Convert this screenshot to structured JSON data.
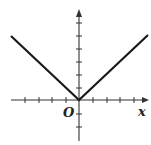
{
  "diagram": {
    "type": "function-graph",
    "function": "y = |x|",
    "axes": {
      "x_label": "x",
      "origin_label": "O",
      "x_ticks_left": 4,
      "x_ticks_right": 4,
      "y_ticks_above": 6,
      "y_ticks_below": 2,
      "tick_spacing_px": 13.6
    },
    "graph_lines": [
      {
        "name": "left-branch",
        "from": [
          0,
          0
        ],
        "to": [
          -5,
          5
        ]
      },
      {
        "name": "right-branch",
        "from": [
          0,
          0
        ],
        "to": [
          5,
          5
        ]
      }
    ],
    "colors": {
      "line": "#1a1a1a",
      "axis": "#333333",
      "background": "#ffffff"
    }
  }
}
